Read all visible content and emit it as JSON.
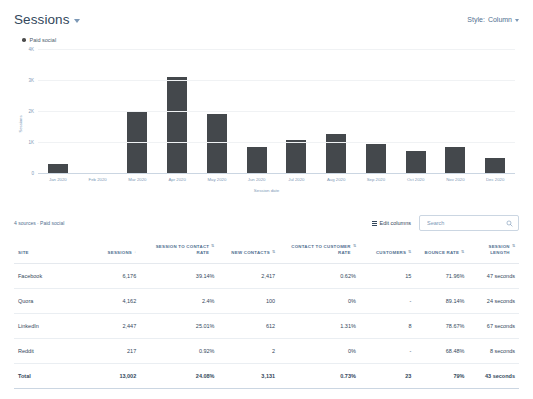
{
  "chart": {
    "title": "Sessions",
    "title_caret_icon": "chevron-down-icon",
    "style_label": "Style:",
    "style_value": "Column",
    "legend": [
      {
        "label": "Paid social",
        "color": "#44484c"
      }
    ]
  },
  "chart_data": {
    "type": "bar",
    "title": "Sessions",
    "xlabel": "Session date",
    "ylabel": "Sessions",
    "categories": [
      "Jan 2020",
      "Feb 2020",
      "Mar 2020",
      "Apr 2020",
      "May 2020",
      "Jun 2020",
      "Jul 2020",
      "Aug 2020",
      "Sep 2020",
      "Oct 2020",
      "Nov 2020",
      "Dec 2020"
    ],
    "series": [
      {
        "name": "Paid social",
        "color": "#44484c",
        "values": [
          300,
          0,
          2000,
          3100,
          1900,
          850,
          1050,
          1250,
          950,
          700,
          850,
          500
        ]
      }
    ],
    "ylim": [
      0,
      4000
    ],
    "yticks": [
      0,
      1000,
      2000,
      3000,
      4000
    ],
    "ytick_labels": [
      "0",
      "1K",
      "2K",
      "3K",
      "4K"
    ],
    "grid": true,
    "legend_position": "top-left"
  },
  "toolbar": {
    "source_summary": "4 sources · Paid social",
    "edit_columns_label": "Edit columns",
    "edit_columns_icon": "columns-icon",
    "search_placeholder": "Search",
    "search_value": "",
    "search_icon": "search-icon"
  },
  "table": {
    "columns": [
      {
        "key": "site",
        "label": "SITE",
        "sort": "none"
      },
      {
        "key": "sess",
        "label": "SESSIONS",
        "sort": "desc"
      },
      {
        "key": "s2c",
        "label": "SESSION TO CONTACT RATE",
        "sort": "none"
      },
      {
        "key": "new",
        "label": "NEW CONTACTS",
        "sort": "none"
      },
      {
        "key": "c2c",
        "label": "CONTACT TO CUSTOMER RATE",
        "sort": "none"
      },
      {
        "key": "cust",
        "label": "CUSTOMERS",
        "sort": "none"
      },
      {
        "key": "bounce",
        "label": "BOUNCE RATE",
        "sort": "none"
      },
      {
        "key": "len",
        "label": "SESSION LENGTH",
        "sort": "none"
      }
    ],
    "rows": [
      {
        "site": "Facebook",
        "sess": "6,176",
        "s2c": "39.14%",
        "new": "2,417",
        "c2c": "0.62%",
        "cust": "15",
        "bounce": "71.96%",
        "len": "47 seconds"
      },
      {
        "site": "Quora",
        "sess": "4,162",
        "s2c": "2.4%",
        "new": "100",
        "c2c": "0%",
        "cust": "-",
        "bounce": "89.14%",
        "len": "24 seconds"
      },
      {
        "site": "LinkedIn",
        "sess": "2,447",
        "s2c": "25.01%",
        "new": "612",
        "c2c": "1.31%",
        "cust": "8",
        "bounce": "78.67%",
        "len": "67 seconds"
      },
      {
        "site": "Reddit",
        "sess": "217",
        "s2c": "0.92%",
        "new": "2",
        "c2c": "0%",
        "cust": "-",
        "bounce": "68.48%",
        "len": "8 seconds"
      }
    ],
    "total": {
      "site": "Total",
      "sess": "13,002",
      "s2c": "24.08%",
      "new": "3,131",
      "c2c": "0.73%",
      "cust": "23",
      "bounce": "79%",
      "len": "43 seconds"
    }
  }
}
